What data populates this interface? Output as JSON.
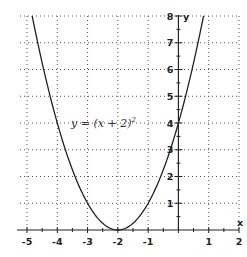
{
  "chart_data": {
    "type": "line",
    "title": "",
    "xlabel": "x",
    "ylabel": "y",
    "xlim": [
      -5,
      2
    ],
    "ylim": [
      0,
      8
    ],
    "x_ticks": [
      -5,
      -4,
      -3,
      -2,
      -1,
      1,
      2
    ],
    "x_tick_labels": [
      "-5",
      "-4",
      "-3",
      "-2",
      "-1",
      "1",
      "2"
    ],
    "y_ticks": [
      1,
      2,
      3,
      4,
      5,
      6,
      7,
      8
    ],
    "y_tick_labels": [
      "1",
      "2",
      "3",
      "4",
      "5",
      "6",
      "7",
      "8"
    ],
    "grid": true,
    "grid_style": "dotted",
    "series": [
      {
        "name": "y = (x + 2)^2",
        "function": "(x+2)^2",
        "x": [
          -4.83,
          -4.5,
          -4,
          -3.5,
          -3,
          -2.5,
          -2,
          -1.5,
          -1,
          -0.5,
          0,
          0.5,
          0.83
        ],
        "y": [
          8.0,
          6.25,
          4,
          2.25,
          1,
          0.25,
          0,
          0.25,
          1,
          2.25,
          4,
          6.25,
          8.0
        ]
      }
    ],
    "annotations": [
      {
        "text_prefix": "y = (x + 2)",
        "superscript": "2",
        "x": -3.6,
        "y": 4.2
      }
    ],
    "colors": {
      "curve": "#222222",
      "axis": "#222222",
      "grid": "#555555"
    }
  }
}
